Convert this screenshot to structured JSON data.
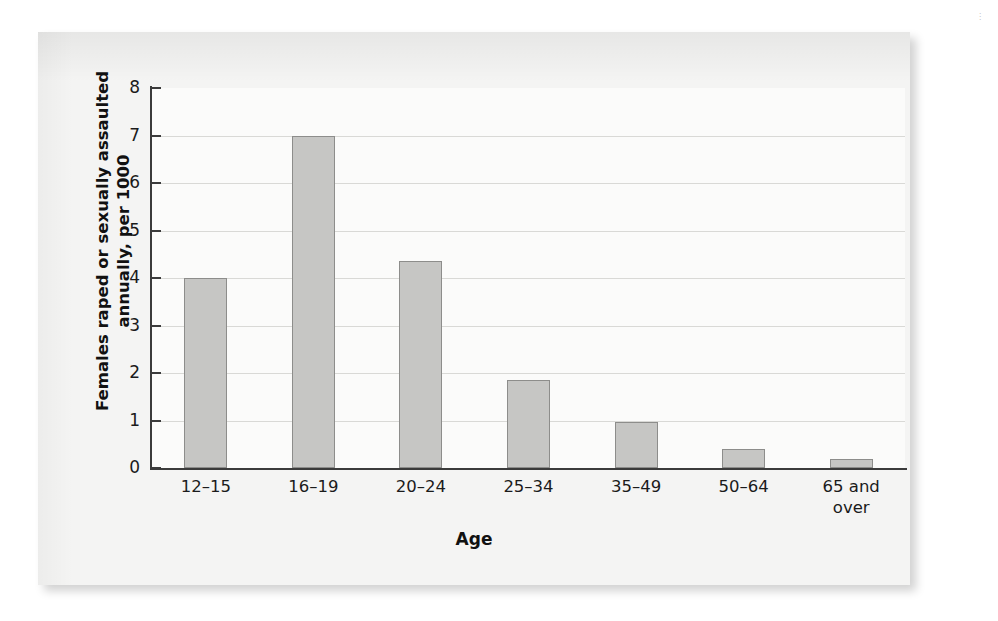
{
  "figure": {
    "background_color": "#f4f4f3",
    "bar_fill_color": "#c6c6c4",
    "bar_border_color": "#8d8d8b",
    "axis_color": "#3b3b3b",
    "gridline_color": "#d9d9d6"
  },
  "chart_data": {
    "type": "bar",
    "title": "",
    "subtitle": "",
    "categories": [
      "12–15",
      "16–19",
      "20–24",
      "25–34",
      "35–49",
      "50–64",
      "65 and over"
    ],
    "category_lines": [
      [
        "12–15"
      ],
      [
        "16–19"
      ],
      [
        "20–24"
      ],
      [
        "25–34"
      ],
      [
        "35–49"
      ],
      [
        "50–64"
      ],
      [
        "65 and",
        "over"
      ]
    ],
    "values": [
      4.0,
      7.0,
      4.35,
      1.85,
      0.97,
      0.4,
      0.2
    ],
    "xlabel": "Age",
    "ylabel": "Females raped or sexually assaulted annually, per 1000",
    "ylabel_lines": [
      "Females raped or sexually assaulted",
      "annually, per 1000"
    ],
    "ylim": [
      0,
      8
    ],
    "ytick_labels": [
      "8",
      "7",
      "6",
      "5",
      "4",
      "3",
      "2",
      "1",
      "0"
    ],
    "ytick_values": [
      8,
      7,
      6,
      5,
      4,
      3,
      2,
      1,
      0
    ],
    "grid": true,
    "grid_axis": "y",
    "legend": false,
    "legend_position": "none"
  },
  "margin_note": "⋮"
}
